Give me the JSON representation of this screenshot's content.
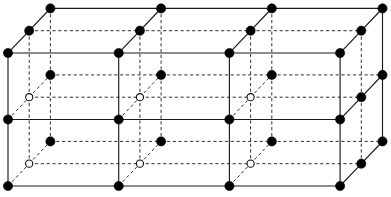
{
  "figure": {
    "background_color": "#ffffff",
    "line_color": "#1a1a1a",
    "node_fill_color": "#000000",
    "node_open_color": "#ffffff"
  },
  "geometry": {
    "canvas_width": 391,
    "canvas_height": 197,
    "cell_step_x": 110.7,
    "cell_step_y": 66.5,
    "depth_step_x": 21.2,
    "depth_step_y": -22.3,
    "origin_x": 8,
    "origin_y": 186,
    "columns": 4,
    "rows": 3,
    "depth_planes": 3,
    "node_radius_filled": 4.6,
    "node_radius_open": 3.6
  },
  "lattice": {
    "columns_x": [
      8,
      118.7,
      229.4,
      340.1
    ],
    "rows_y": [
      53,
      119.5,
      186
    ],
    "depth_offsets": [
      {
        "name": "front",
        "dx": 0,
        "dy": 0
      },
      {
        "name": "middle",
        "dx": 21.2,
        "dy": -22.3
      },
      {
        "name": "back",
        "dx": 42.4,
        "dy": -44.6
      }
    ],
    "node_style_by_plane": [
      "filled",
      "open",
      "filled"
    ],
    "notes": "Front and back planes render filled nodes; the middle depth plane renders open nodes where occluded."
  },
  "labels": {
    "caption": "",
    "axis_labels": [],
    "annotations": []
  },
  "legend": {
    "visible": false,
    "entries": [
      {
        "symbol": "filled-circle",
        "label": "Visible lattice point"
      },
      {
        "symbol": "open-circle",
        "label": "Occluded lattice point"
      }
    ]
  }
}
